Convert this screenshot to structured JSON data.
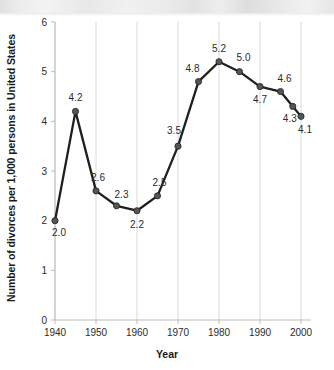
{
  "chart_data": {
    "type": "line",
    "title": "",
    "xlabel": "Year",
    "ylabel": "Number of divorces per 1,000 persons in United States",
    "x": [
      1940,
      1945,
      1950,
      1955,
      1960,
      1965,
      1970,
      1975,
      1980,
      1985,
      1990,
      1995,
      1998,
      2000
    ],
    "values": [
      2.0,
      4.2,
      2.6,
      2.3,
      2.2,
      2.5,
      3.5,
      4.8,
      5.2,
      5.0,
      4.7,
      4.6,
      4.3,
      4.1
    ],
    "point_labels": [
      "2.0",
      "4.2",
      "2.6",
      "2.3",
      "2.2",
      "2.5",
      "3.5",
      "4.8",
      "5.2",
      "5.0",
      "4.7",
      "4.6",
      "4.3",
      "4.1"
    ],
    "xlim": [
      1940,
      2000
    ],
    "ylim": [
      0,
      6
    ],
    "xticks": [
      1940,
      1950,
      1960,
      1970,
      1980,
      1990,
      2000
    ],
    "xtick_labels": [
      "1940",
      "1950",
      "1960",
      "1970",
      "1980",
      "1990",
      "2000"
    ],
    "yticks": [
      0,
      1,
      2,
      3,
      4,
      5,
      6
    ],
    "ytick_labels": [
      "0",
      "1",
      "2",
      "3",
      "4",
      "5",
      "6"
    ],
    "grid": "vertical",
    "legend": "none",
    "series_color": "#1f1f1f",
    "marker_color": "#555555",
    "grid_color": "#d9d9d9",
    "axis_color": "#bdbdbd",
    "background": "#ffffff"
  },
  "label_offsets": [
    {
      "dx": 4,
      "dy": 15
    },
    {
      "dx": 0,
      "dy": -10
    },
    {
      "dx": 2,
      "dy": -10
    },
    {
      "dx": 5,
      "dy": -8
    },
    {
      "dx": 0,
      "dy": 17
    },
    {
      "dx": 2,
      "dy": -10
    },
    {
      "dx": -4,
      "dy": -12
    },
    {
      "dx": -6,
      "dy": -10
    },
    {
      "dx": 0,
      "dy": -10
    },
    {
      "dx": 4,
      "dy": -11
    },
    {
      "dx": 0,
      "dy": 16
    },
    {
      "dx": 4,
      "dy": -10
    },
    {
      "dx": -3,
      "dy": 16
    },
    {
      "dx": 4,
      "dy": 17
    }
  ]
}
